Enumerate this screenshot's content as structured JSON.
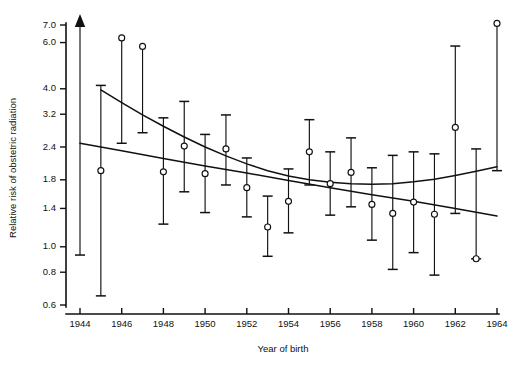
{
  "chart_data": {
    "type": "scatter",
    "title": "",
    "xlabel": "Year of birth",
    "ylabel": "Relative risk of obstetric radiation",
    "y_scale": "log",
    "grid": false,
    "legend": "none",
    "xlim": [
      1943.2,
      1964.4
    ],
    "ylim": [
      0.55,
      7.3
    ],
    "x_ticks": [
      1944,
      1946,
      1948,
      1950,
      1952,
      1954,
      1956,
      1958,
      1960,
      1962,
      1964
    ],
    "x_tick_labels": [
      "1944",
      "1946",
      "1948",
      "1950",
      "1952",
      "1954",
      "1956",
      "1958",
      "1960",
      "1962",
      "1964"
    ],
    "y_ticks": [
      0.6,
      0.8,
      1.0,
      1.4,
      1.8,
      2.4,
      3.2,
      4.0,
      6.0,
      7.0
    ],
    "y_tick_labels": [
      "0.6",
      "0.8",
      "1.0",
      "1.4",
      "1.8",
      "2.4",
      "3.2",
      "4.0",
      "6.0",
      "7.0"
    ],
    "marker": "open-circle",
    "error_bar_style": "capped-vertical",
    "points": [
      {
        "x": 1944,
        "y": 2.48,
        "low": 0.93,
        "high": 7.3,
        "high_arrow": true,
        "marker_hidden": true
      },
      {
        "x": 1945,
        "y": 1.95,
        "low": 0.65,
        "high": 4.12,
        "high_arrow": false,
        "marker_hidden": false
      },
      {
        "x": 1946,
        "y": 6.25,
        "low": 2.48,
        "high": 6.25,
        "high_arrow": false,
        "marker_hidden": false
      },
      {
        "x": 1947,
        "y": 5.8,
        "low": 2.72,
        "high": 5.8,
        "high_arrow": false,
        "marker_hidden": false
      },
      {
        "x": 1948,
        "y": 1.93,
        "low": 1.22,
        "high": 3.1,
        "high_arrow": false,
        "marker_hidden": false
      },
      {
        "x": 1949,
        "y": 2.42,
        "low": 1.62,
        "high": 3.58,
        "high_arrow": false,
        "marker_hidden": false
      },
      {
        "x": 1950,
        "y": 1.9,
        "low": 1.35,
        "high": 2.68,
        "high_arrow": false,
        "marker_hidden": false
      },
      {
        "x": 1951,
        "y": 2.36,
        "low": 1.72,
        "high": 3.18,
        "high_arrow": false,
        "marker_hidden": false
      },
      {
        "x": 1952,
        "y": 1.68,
        "low": 1.3,
        "high": 2.18,
        "high_arrow": false,
        "marker_hidden": false
      },
      {
        "x": 1953,
        "y": 1.19,
        "low": 0.92,
        "high": 1.56,
        "high_arrow": false,
        "marker_hidden": false
      },
      {
        "x": 1954,
        "y": 1.49,
        "low": 1.13,
        "high": 1.98,
        "high_arrow": false,
        "marker_hidden": false
      },
      {
        "x": 1955,
        "y": 2.3,
        "low": 1.72,
        "high": 3.05,
        "high_arrow": false,
        "marker_hidden": false
      },
      {
        "x": 1956,
        "y": 1.74,
        "low": 1.32,
        "high": 2.3,
        "high_arrow": false,
        "marker_hidden": false
      },
      {
        "x": 1957,
        "y": 1.92,
        "low": 1.42,
        "high": 2.6,
        "high_arrow": false,
        "marker_hidden": false
      },
      {
        "x": 1958,
        "y": 1.45,
        "low": 1.06,
        "high": 2.0,
        "high_arrow": false,
        "marker_hidden": false
      },
      {
        "x": 1959,
        "y": 1.34,
        "low": 0.82,
        "high": 2.23,
        "high_arrow": false,
        "marker_hidden": false
      },
      {
        "x": 1960,
        "y": 1.48,
        "low": 0.95,
        "high": 2.3,
        "high_arrow": false,
        "marker_hidden": false
      },
      {
        "x": 1961,
        "y": 1.33,
        "low": 0.78,
        "high": 2.26,
        "high_arrow": false,
        "marker_hidden": false
      },
      {
        "x": 1962,
        "y": 2.85,
        "low": 1.34,
        "high": 5.82,
        "high_arrow": false,
        "marker_hidden": false
      },
      {
        "x": 1963,
        "y": 0.9,
        "low": 0.9,
        "high": 2.36,
        "high_arrow": false,
        "marker_hidden": false
      },
      {
        "x": 1964,
        "y": 7.1,
        "low": 1.95,
        "high": 7.1,
        "high_arrow": false,
        "marker_hidden": false
      }
    ],
    "series": [
      {
        "name": "fitted-curve-steep",
        "type": "line",
        "x": [
          1945.0,
          1946.0,
          1947.0,
          1948.0,
          1949.0,
          1950.0,
          1951.0,
          1952.0,
          1953.0,
          1954.0,
          1955.0,
          1956.0,
          1957.0,
          1958.0,
          1959.0,
          1960.0,
          1961.0,
          1962.0,
          1963.0,
          1964.0
        ],
        "values": [
          3.96,
          3.54,
          3.18,
          2.88,
          2.62,
          2.4,
          2.22,
          2.07,
          1.95,
          1.86,
          1.8,
          1.76,
          1.74,
          1.73,
          1.74,
          1.77,
          1.81,
          1.87,
          1.94,
          2.02
        ]
      },
      {
        "name": "fitted-curve-shallow",
        "type": "line",
        "x": [
          1944.0,
          1946.0,
          1948.0,
          1950.0,
          1952.0,
          1954.0,
          1956.0,
          1958.0,
          1960.0,
          1962.0,
          1964.0
        ],
        "values": [
          2.48,
          2.32,
          2.17,
          2.03,
          1.91,
          1.79,
          1.68,
          1.58,
          1.49,
          1.4,
          1.31
        ]
      }
    ],
    "annotations": [
      {
        "kind": "up-arrow",
        "x": 1944,
        "note": "upper confidence limit extends beyond axis"
      }
    ]
  },
  "axes": {
    "y_title": "Relative risk of obstetric radiation",
    "x_title": "Year of birth"
  }
}
